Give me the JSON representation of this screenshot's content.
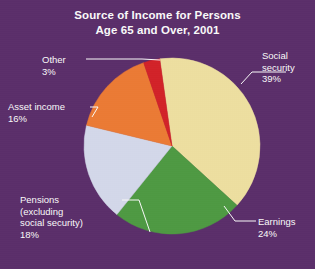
{
  "background_color": "#5a2c6a",
  "title": {
    "line1": "Source of Income for Persons",
    "line2": "Age 65 and Over, 2001",
    "color": "#ffffff"
  },
  "labels": {
    "social_security": {
      "name": "Social",
      "name2": "security",
      "value": "39%"
    },
    "earnings": {
      "name": "Earnings",
      "value": "24%"
    },
    "pensions": {
      "line1": "Pensions",
      "line2": "(excluding",
      "line3": "social security)",
      "value": "18%"
    },
    "asset_income": {
      "name": "Asset  income",
      "value": "16%"
    },
    "other": {
      "name": "Other",
      "value": "3%"
    }
  },
  "chart_data": {
    "type": "pie",
    "title": "Source of Income for Persons Age 65 and Over, 2001",
    "xlabel": "",
    "ylabel": "",
    "units": "percent",
    "total": 100,
    "legend": "none",
    "labels_placement": "external callouts with leader lines",
    "start_angle_deg": -8,
    "direction": "clockwise",
    "categories": [
      "Social security",
      "Earnings",
      "Pensions (excluding social security)",
      "Asset income",
      "Other"
    ],
    "values": [
      39,
      24,
      18,
      16,
      3
    ],
    "value_labels": [
      "39%",
      "24%",
      "18%",
      "16%",
      "3%"
    ],
    "colors": [
      "#f2e3a2",
      "#4d9b41",
      "#d7dcee",
      "#f07b32",
      "#d61f26"
    ],
    "slices": [
      {
        "label": "Social security",
        "value": 39,
        "display": "39%",
        "color": "#f2e3a2"
      },
      {
        "label": "Earnings",
        "value": 24,
        "display": "24%",
        "color": "#4d9b41"
      },
      {
        "label": "Pensions (excluding social security)",
        "value": 18,
        "display": "18%",
        "color": "#d7dcee"
      },
      {
        "label": "Asset income",
        "value": 16,
        "display": "16%",
        "color": "#f07b32"
      },
      {
        "label": "Other",
        "value": 3,
        "display": "3%",
        "color": "#d61f26"
      }
    ]
  }
}
